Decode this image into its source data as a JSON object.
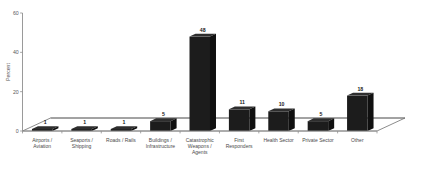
{
  "chart_data": {
    "type": "bar",
    "title": "",
    "subtitle": "",
    "xlabel": "",
    "ylabel": "Percent",
    "ylim": [
      0,
      60
    ],
    "yticks": [
      0,
      20,
      40,
      60
    ],
    "ytick_labels": [
      "0",
      "20",
      "40",
      "60"
    ],
    "grid": false,
    "legend": null,
    "style": "3d-perspective",
    "bar_color": "#1c1c1c",
    "categories": [
      "Airports / Aviation",
      "Seaports / Shipping",
      "Roads / Rails",
      "Buildings / Infrastructure",
      "Catastrophic Weapons / Agents",
      "First Responders",
      "Health Sector",
      "Private Sector",
      "Other"
    ],
    "category_lines": [
      [
        "Airports /",
        "Aviation"
      ],
      [
        "Seaports /",
        "Shipping"
      ],
      [
        "Roads / Rails"
      ],
      [
        "Buildings /",
        "Infrastructure"
      ],
      [
        "Catastrophic",
        "Weapons /",
        "Agents"
      ],
      [
        "First",
        "Responders"
      ],
      [
        "Health Sector"
      ],
      [
        "Private Sector"
      ],
      [
        "Other"
      ]
    ],
    "values": [
      1,
      1,
      1,
      5,
      48,
      11,
      10,
      5,
      18
    ],
    "value_labels": [
      "1",
      "1",
      "1",
      "5",
      "48",
      "11",
      "10",
      "5",
      "18"
    ]
  }
}
